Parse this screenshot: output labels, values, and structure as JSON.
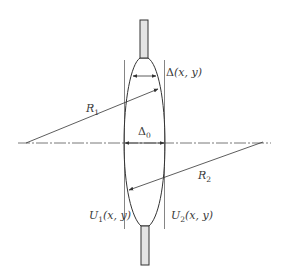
{
  "diagram": {
    "title": "",
    "colors": {
      "stroke": "#3a3a3a",
      "thin_stroke": "#6b6b6b",
      "rod_fill": "#e4e4e4",
      "background": "#ffffff"
    },
    "labels": {
      "delta_xy": {
        "symbol": "Δ",
        "args": "(x, y)"
      },
      "r1": {
        "symbol": "R",
        "sub": "1"
      },
      "delta0": {
        "symbol": "Δ",
        "sub": "0"
      },
      "r2": {
        "symbol": "R",
        "sub": "2"
      },
      "u1": {
        "symbol": "U",
        "sub": "1",
        "args": "(x, y)"
      },
      "u2": {
        "symbol": "U",
        "sub": "2",
        "args": "(x, y)"
      }
    },
    "elements": [
      "top-rod",
      "bottom-rod",
      "lens-profile",
      "left-tangent-plane",
      "right-tangent-plane",
      "optical-axis",
      "radius-r1-arrow",
      "radius-r2-arrow",
      "thickness-delta-xy-dimension",
      "center-thickness-delta0-dimension"
    ]
  }
}
